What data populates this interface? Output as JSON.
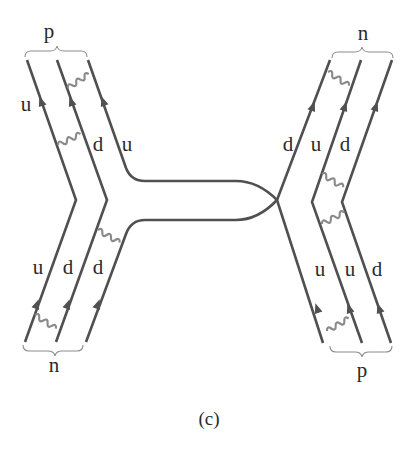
{
  "diagram": {
    "caption": "(c)",
    "left": {
      "top_hadron": "p",
      "bottom_hadron": "n",
      "top_quark_labels": [
        "u",
        "d",
        "u"
      ],
      "bottom_quark_labels": [
        "u",
        "d",
        "d"
      ]
    },
    "right": {
      "top_hadron": "n",
      "bottom_hadron": "p",
      "top_quark_labels": [
        "d",
        "u",
        "d"
      ],
      "bottom_quark_labels": [
        "u",
        "u",
        "d"
      ]
    },
    "colors": {
      "quark_line": "#505050",
      "gluon": "#8a8a8a",
      "brace": "#8c8c8c",
      "text": "#2a2a2a",
      "background": "#ffffff"
    }
  }
}
